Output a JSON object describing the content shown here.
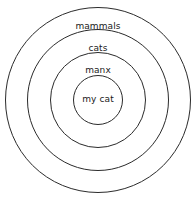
{
  "diagram": {
    "type": "concentric-set-diagram",
    "background_color": "#ffffff",
    "stroke_color": "#2b2b2b",
    "text_color": "#1a1a1a",
    "center": {
      "x": 98,
      "y": 100
    },
    "rings": [
      {
        "id": "mammals",
        "label": "mammals",
        "level": 1,
        "radius": 93,
        "label_offset_y": 14
      },
      {
        "id": "cats",
        "label": "cats",
        "level": 2,
        "radius": 71,
        "label_offset_y": 14
      },
      {
        "id": "manx",
        "label": "manx",
        "level": 3,
        "radius": 48,
        "label_offset_y": 13
      },
      {
        "id": "my-cat",
        "label": "my cat",
        "level": 4,
        "radius": 25,
        "label_offset_y": 19
      }
    ]
  }
}
